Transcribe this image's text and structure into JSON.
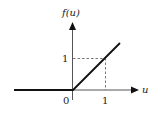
{
  "diagram": {
    "y_axis_label": "f(u)",
    "x_axis_label": "u",
    "origin_label": "0",
    "x_tick_label": "1",
    "y_tick_label": "1",
    "colors": {
      "line": "#111111",
      "axis": "#555555",
      "dashed": "#555555"
    }
  }
}
